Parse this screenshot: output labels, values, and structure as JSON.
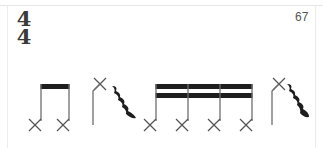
{
  "score": {
    "time_signature": {
      "numerator": "4",
      "denominator": "4"
    },
    "measure_number": "67",
    "colors": {
      "ink": "#1e1e1e",
      "stem": "#6e6e6e",
      "frame": "#e4e4e4",
      "text": "#555555"
    },
    "elements": [
      {
        "type": "beamed-group",
        "duration": "eighth",
        "notehead": "x",
        "count": 2
      },
      {
        "type": "note",
        "duration": "quarter",
        "notehead": "x",
        "stem": "down-from-top"
      },
      {
        "type": "rest",
        "duration": "quarter"
      },
      {
        "type": "beamed-group",
        "duration": "sixteenth",
        "notehead": "x",
        "count": 4
      },
      {
        "type": "note",
        "duration": "quarter",
        "notehead": "x",
        "stem": "down-from-top"
      },
      {
        "type": "rest",
        "duration": "quarter"
      }
    ]
  }
}
